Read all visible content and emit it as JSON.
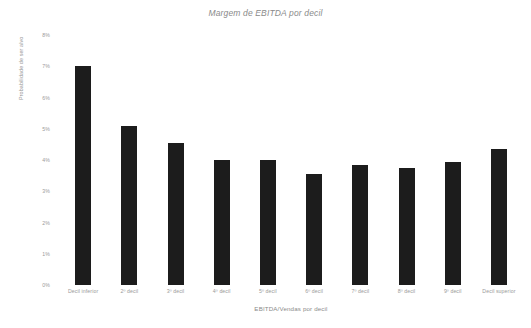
{
  "chart_data": {
    "type": "bar",
    "title": "Margem de EBITDA por decil",
    "xlabel": "EBITDA/Vendas por decil",
    "ylabel": "Probabilidade de ser alvo",
    "categories": [
      "Decil inferior",
      "2º decil",
      "3º decil",
      "4º decil",
      "5º decil",
      "6º decil",
      "7º decil",
      "8º decil",
      "9º decil",
      "Decil superior"
    ],
    "values": [
      7.0,
      5.1,
      4.55,
      4.0,
      4.0,
      3.55,
      3.85,
      3.75,
      3.95,
      4.35
    ],
    "ylim": [
      0,
      8
    ],
    "ytick_labels": [
      "8%",
      "7%",
      "6%",
      "5%",
      "4%",
      "3%",
      "2%",
      "1%",
      "0%"
    ],
    "ytick_values": [
      8,
      7,
      6,
      5,
      4,
      3,
      2,
      1,
      0
    ],
    "grid": false,
    "legend": false,
    "bar_color": "#1c1c1c",
    "text_color": "#9a9a9a",
    "background_color": "#ffffff"
  }
}
